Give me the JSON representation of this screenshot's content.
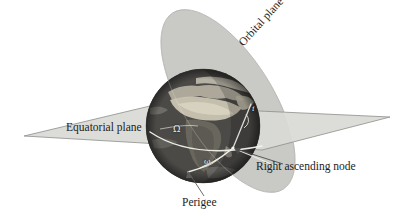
{
  "figure": {
    "background": "#ffffff"
  },
  "labels": {
    "equatorial_plane": "Equatorial plane",
    "orbital_plane": "Orbital plane",
    "right_ascending_node": "Right ascending node",
    "perigee": "Perigee"
  },
  "symbols": {
    "raan": "Ω",
    "arg_perigee": "ω",
    "inclination": "i"
  },
  "colors": {
    "plane_fill": "#c9c9c6",
    "plane_stroke": "#8d8d8a",
    "equatorial_fill": "#d8d8d4",
    "orbit_line": "#f4f4ee",
    "text": "#1c1c1c",
    "globe_dark": "#3a3a38",
    "globe_land": "#b9b4a6",
    "globe_ocean": "#4e4e4c"
  },
  "geometry": {
    "globe": {
      "cx": 203,
      "cy": 126,
      "r": 57
    },
    "equatorial_plane_points": "24,136 150,106 390,117 262,150",
    "orbital_plane_ellipse": {
      "cx": 228,
      "cy": 101,
      "rx": 45,
      "ry": 104,
      "rotation": -32
    },
    "ascending_node": {
      "x": 233,
      "y": 148
    },
    "perigee_point": {
      "x": 188,
      "y": 172
    }
  },
  "elements": [
    {
      "name": "equatorial-plane",
      "type": "plane"
    },
    {
      "name": "orbital-plane",
      "type": "plane"
    },
    {
      "name": "earth-globe",
      "type": "sphere"
    },
    {
      "name": "equator-arc",
      "type": "curve"
    },
    {
      "name": "orbit-arc",
      "type": "curve"
    },
    {
      "name": "perigee-leader-line",
      "type": "leader"
    },
    {
      "name": "ascending-node-leader-line",
      "type": "leader"
    }
  ]
}
